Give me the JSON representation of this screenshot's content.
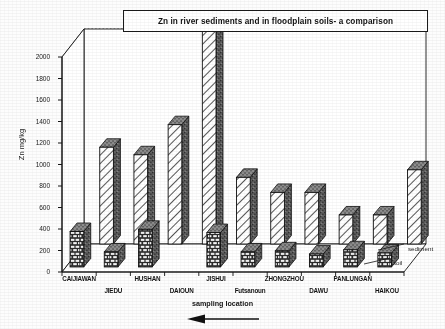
{
  "chart_data": {
    "type": "bar",
    "title": "Zn in river sediments and in floodplain soils- a comparison",
    "xlabel": "sampling location",
    "ylabel": "Zn mg/kg",
    "ylim": [
      0,
      2000
    ],
    "yticks": [
      0,
      200,
      400,
      600,
      800,
      1000,
      1200,
      1400,
      1600,
      1800,
      2000
    ],
    "ytick_labels": [
      "0",
      "200",
      "400",
      "600",
      "800",
      "1000",
      "1200",
      "1400",
      "1600",
      "1800",
      "2000"
    ],
    "grid": true,
    "legend_position": "right-bottom",
    "projection": "3d-bar",
    "categories": [
      "CAIJIAWAN",
      "JIEDU",
      "HUSHAN",
      "DAIOUN",
      "JISHUI",
      "Futsanoun",
      "ZHONGZHOU",
      "DAWU",
      "PANLUNGAN",
      "HAIKOU"
    ],
    "series": [
      {
        "name": "sediment",
        "pattern": "diagonal-hatch",
        "values": [
          900,
          830,
          1110,
          2090,
          620,
          480,
          480,
          270,
          270,
          690
        ]
      },
      {
        "name": "soil",
        "pattern": "brick",
        "values": [
          330,
          140,
          350,
          0,
          320,
          140,
          150,
          120,
          160,
          130
        ]
      }
    ],
    "annotations": {
      "x_axis_arrow": "left-pointing-arrow"
    }
  },
  "legend": {
    "items": [
      {
        "label": "sediment"
      },
      {
        "label": "soil"
      }
    ]
  },
  "colors": {
    "ink": "#141414",
    "grid": "#3a3a3a",
    "bar_face_light": "#ffffff",
    "bar_side_dark": "#6e6e6e",
    "bar_top": "#9a9a9a",
    "background": "#fdfdfd"
  }
}
